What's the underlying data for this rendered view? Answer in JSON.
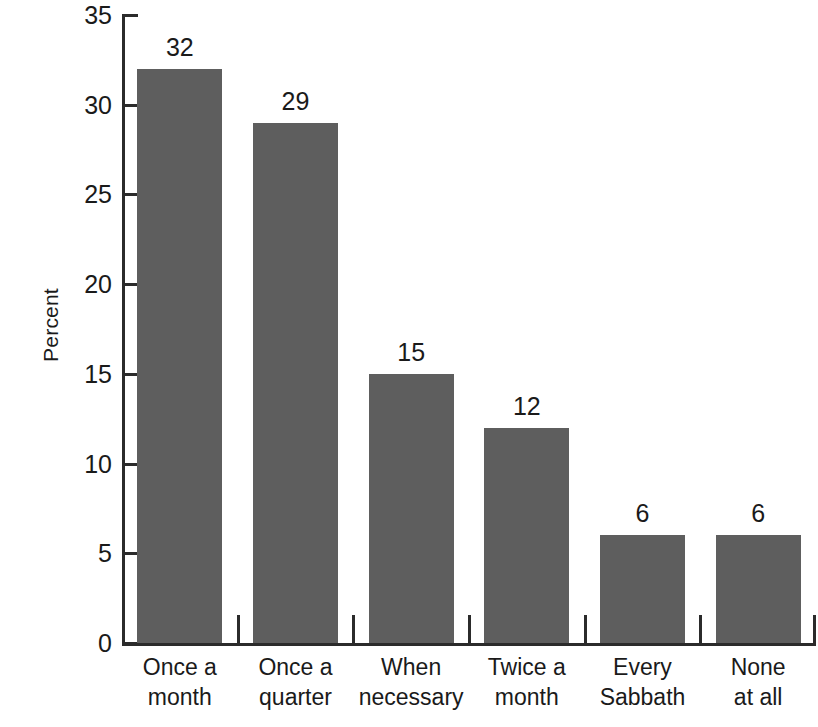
{
  "chart_data": {
    "type": "bar",
    "title": "",
    "subtitle": "",
    "xlabel": "",
    "ylabel": "Percent",
    "ylim": [
      0,
      35
    ],
    "yticks": [
      0,
      5,
      10,
      15,
      20,
      25,
      30,
      35
    ],
    "ytick_labels": [
      "0",
      "5",
      "10",
      "15",
      "20",
      "25",
      "30",
      "35"
    ],
    "grid": false,
    "legend": false,
    "categories": [
      "Once a month",
      "Once a quarter",
      "When necessary",
      "Twice a month",
      "Every Sabbath",
      "None at all"
    ],
    "category_lines": [
      [
        "Once a",
        "month"
      ],
      [
        "Once a",
        "quarter"
      ],
      [
        "When",
        "necessary"
      ],
      [
        "Twice a",
        "month"
      ],
      [
        "Every",
        "Sabbath"
      ],
      [
        "None",
        "at all"
      ]
    ],
    "values": [
      32,
      29,
      15,
      12,
      6,
      6
    ],
    "value_labels": [
      "32",
      "29",
      "15",
      "12",
      "6",
      "6"
    ],
    "bar_color": "#5e5e5e",
    "axis_color": "#2b2b2b",
    "text_color": "#1a1a1a",
    "background_color": "#ffffff"
  }
}
